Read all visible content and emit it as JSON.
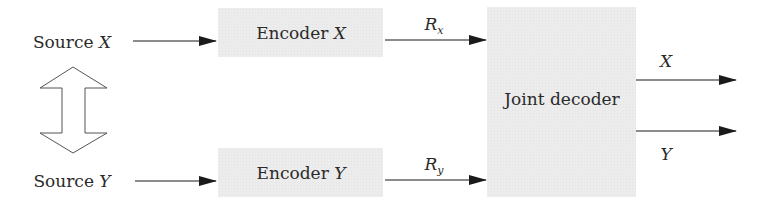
{
  "diagram": {
    "title": "",
    "sources": [
      {
        "id": "source-x",
        "label": "Source",
        "var": "X"
      },
      {
        "id": "source-y",
        "label": "Source",
        "var": "Y"
      }
    ],
    "encoders": [
      {
        "id": "encoder-x",
        "label": "Encoder",
        "var": "X"
      },
      {
        "id": "encoder-y",
        "label": "Encoder",
        "var": "Y"
      }
    ],
    "rates": [
      {
        "id": "rate-x",
        "symbol": "R",
        "sub": "x"
      },
      {
        "id": "rate-y",
        "symbol": "R",
        "sub": "y"
      }
    ],
    "decoder": {
      "id": "joint-decoder",
      "label": "Joint decoder"
    },
    "outputs": [
      {
        "id": "output-x",
        "var": "X"
      },
      {
        "id": "output-y",
        "var": "Y"
      }
    ],
    "correlation": {
      "id": "correlation-arrow",
      "type": "double-headed-hollow-arrow"
    },
    "colors": {
      "box_fill": "#ececec",
      "line": "#1a1a1a",
      "text": "#2a2a2a"
    },
    "edges": [
      {
        "from": "source-x",
        "to": "encoder-x"
      },
      {
        "from": "source-y",
        "to": "encoder-y"
      },
      {
        "from": "encoder-x",
        "to": "joint-decoder",
        "label": "rate-x"
      },
      {
        "from": "encoder-y",
        "to": "joint-decoder",
        "label": "rate-y"
      },
      {
        "from": "joint-decoder",
        "to": "output-x"
      },
      {
        "from": "joint-decoder",
        "to": "output-y"
      },
      {
        "from": "source-x",
        "to": "source-y",
        "label": "correlation-arrow"
      }
    ]
  }
}
